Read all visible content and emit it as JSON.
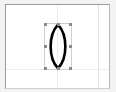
{
  "app": {
    "name": "vector-drawing-canvas",
    "background_color": "#f3f3f3"
  },
  "canvas": {
    "name": "drawing-page",
    "background_color": "#ffffff",
    "border_color": "#9a9a9a",
    "width_px": 105,
    "height_px": 85
  },
  "guides": {
    "horizontal_label": "",
    "vertical_label": "",
    "color": "#ededed"
  },
  "selection": {
    "label": "",
    "box_color": "#cfcfcf",
    "handle_color": "#8a8a8a",
    "handle_count": 8,
    "x": 38,
    "y": 18,
    "width": 28,
    "height": 47
  },
  "shape": {
    "kind": "lens",
    "label": "",
    "stroke_color": "#000000",
    "fill_color": "none",
    "stroke_width": 2.6
  }
}
